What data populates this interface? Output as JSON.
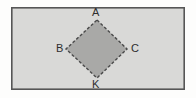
{
  "figure": {
    "kind": "geometry-diagram",
    "background_color": "#fdfdfc",
    "rectangle": {
      "name": "outer-rectangle",
      "fill_color": "#d9d9d7",
      "stroke_color": "#565656",
      "stroke_width": 1.6,
      "x": 11,
      "y": 7,
      "width": 174,
      "height": 83
    },
    "rhombus": {
      "name": "inscribed-rhombus",
      "fill_color": "#a9a9a7",
      "stroke_color": "#4a4a4a",
      "stroke_width": 1.4,
      "stroke_dash": "3 2",
      "points": "97,20 127,49 97,78 66,49"
    },
    "vertices": [
      {
        "id": "A",
        "label": "A",
        "x": 97,
        "y": 20,
        "label_x": 92,
        "label_y": 7
      },
      {
        "id": "B",
        "label": "B",
        "x": 66,
        "y": 49,
        "label_x": 56,
        "label_y": 43
      },
      {
        "id": "C",
        "label": "C",
        "x": 127,
        "y": 49,
        "label_x": 131,
        "label_y": 43
      },
      {
        "id": "K",
        "label": "K",
        "x": 97,
        "y": 78,
        "label_x": 92,
        "label_y": 79
      }
    ]
  }
}
